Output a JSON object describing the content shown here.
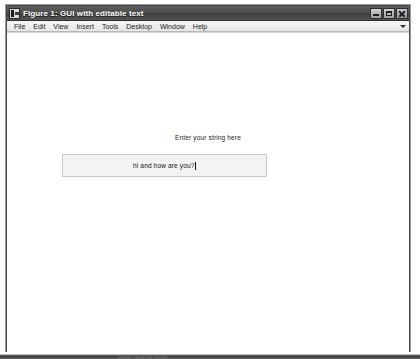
{
  "window": {
    "title": "Figure 1: GUI with editable text",
    "icon": "matlab-figure-icon",
    "controls": {
      "minimize": "minimize-button",
      "maximize": "maximize-button",
      "close": "close-button"
    }
  },
  "menubar": {
    "items": [
      {
        "label": "File"
      },
      {
        "label": "Edit"
      },
      {
        "label": "View"
      },
      {
        "label": "Insert"
      },
      {
        "label": "Tools"
      },
      {
        "label": "Desktop"
      },
      {
        "label": "Window"
      },
      {
        "label": "Help"
      }
    ],
    "overflow_icon": "chevron-down-icon"
  },
  "figure": {
    "background_color": "#ffffff",
    "prompt_label": "Enter your string here",
    "edit_field": {
      "value": "hi and how are you?",
      "background_color": "#f3f3f3",
      "border_color": "#c9c9c9",
      "caret_visible": true
    }
  },
  "bottom_artifact": {
    "text": "ghost taskbar sliver"
  }
}
